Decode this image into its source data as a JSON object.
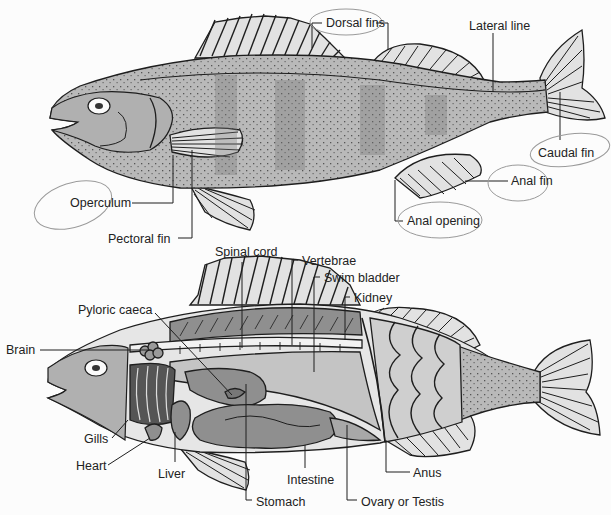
{
  "colors": {
    "background": "#fcfcfc",
    "body_fill": "#b9b9b9",
    "fin_fill": "#e2e2e2",
    "organ_fill": "#8f8f8f",
    "outline": "#1e1e1e",
    "pencil_circle": "#9a9a9a"
  },
  "external_view": {
    "labels": [
      {
        "id": "dorsal-fins",
        "text": "Dorsal fins",
        "x": 326,
        "y": 16
      },
      {
        "id": "lateral-line",
        "text": "Lateral line",
        "x": 469,
        "y": 19
      },
      {
        "id": "caudal-fin",
        "text": "Caudal fin",
        "x": 538,
        "y": 146
      },
      {
        "id": "anal-fin",
        "text": "Anal fin",
        "x": 511,
        "y": 174
      },
      {
        "id": "anal-opening",
        "text": "Anal opening",
        "x": 407,
        "y": 214
      },
      {
        "id": "operculum",
        "text": "Operculum",
        "x": 70,
        "y": 196
      },
      {
        "id": "pectoral-fin",
        "text": "Pectoral fin",
        "x": 108,
        "y": 232
      }
    ]
  },
  "internal_view": {
    "labels": [
      {
        "id": "spinal-cord",
        "text": "Spinal cord",
        "x": 215,
        "y": 245
      },
      {
        "id": "vertebrae",
        "text": "Vertebrae",
        "x": 302,
        "y": 254
      },
      {
        "id": "swim-bladder",
        "text": "Swim bladder",
        "x": 324,
        "y": 271
      },
      {
        "id": "kidney",
        "text": "Kidney",
        "x": 354,
        "y": 291
      },
      {
        "id": "pyloric-caeca",
        "text": "Pyloric caeca",
        "x": 78,
        "y": 303
      },
      {
        "id": "brain",
        "text": "Brain",
        "x": 6,
        "y": 343
      },
      {
        "id": "gills",
        "text": "Gills",
        "x": 84,
        "y": 432
      },
      {
        "id": "heart",
        "text": "Heart",
        "x": 76,
        "y": 459
      },
      {
        "id": "liver",
        "text": "Liver",
        "x": 158,
        "y": 467
      },
      {
        "id": "intestine",
        "text": "Intestine",
        "x": 287,
        "y": 473
      },
      {
        "id": "anus",
        "text": "Anus",
        "x": 413,
        "y": 466
      },
      {
        "id": "stomach",
        "text": "Stomach",
        "x": 256,
        "y": 495
      },
      {
        "id": "ovary-or-testis",
        "text": "Ovary or Testis",
        "x": 361,
        "y": 495
      }
    ]
  }
}
